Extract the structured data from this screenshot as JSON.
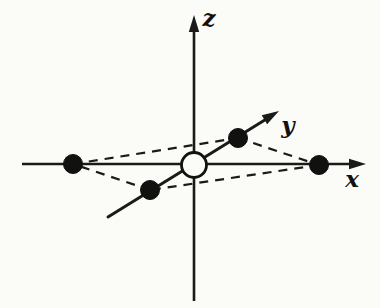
{
  "figure": {
    "kind": "3d-axes-lattice-diagram",
    "title": "",
    "background_color": "#fbfbf8",
    "ink_color": "#111110",
    "canvas": {
      "width": 380,
      "height": 308
    }
  },
  "axes": [
    {
      "id": "x",
      "label": "x",
      "label_x": 352,
      "label_y": 187,
      "label_size": 23,
      "start_x": 22,
      "start_y": 164,
      "end_x": 352,
      "end_y": 164,
      "tip_x": 366,
      "tip_y": 164,
      "stroke_width": 2.6,
      "has_arrow": true,
      "arrow_angle_deg": 0
    },
    {
      "id": "z",
      "label": "z",
      "label_x": 209,
      "label_y": 26,
      "label_size": 23,
      "start_x": 194,
      "start_y": 301,
      "end_x": 194,
      "end_y": 28,
      "tip_x": 194,
      "tip_y": 15,
      "stroke_width": 2.6,
      "has_arrow": true,
      "arrow_angle_deg": -90
    },
    {
      "id": "y",
      "label": "y",
      "label_x": 288,
      "label_y": 133,
      "label_size": 23,
      "start_x": 108,
      "start_y": 217,
      "end_x": 268,
      "end_y": 118,
      "tip_x": 279,
      "tip_y": 111,
      "stroke_width": 3.0,
      "has_arrow": true,
      "arrow_angle_deg": -31
    }
  ],
  "atoms": [
    {
      "id": "atom-left-x",
      "type": "filled",
      "cx": 73,
      "cy": 164,
      "r": 9.5
    },
    {
      "id": "atom-right-x",
      "type": "filled",
      "cx": 319,
      "cy": 165,
      "r": 9.5
    },
    {
      "id": "atom-upper-y",
      "type": "filled",
      "cx": 238,
      "cy": 138,
      "r": 9.5
    },
    {
      "id": "atom-lower-y",
      "type": "filled",
      "cx": 150,
      "cy": 190,
      "r": 9.5
    },
    {
      "id": "atom-center",
      "type": "hollow",
      "cx": 194,
      "cy": 165,
      "r": 12.5
    }
  ],
  "dashed_edges": [
    {
      "id": "edge-left-to-upper",
      "x1": 73,
      "y1": 164,
      "x2": 238,
      "y2": 138
    },
    {
      "id": "edge-upper-to-right",
      "x1": 238,
      "y1": 138,
      "x2": 319,
      "y2": 165
    },
    {
      "id": "edge-right-to-lower",
      "x1": 319,
      "y1": 165,
      "x2": 150,
      "y2": 190
    },
    {
      "id": "edge-lower-to-left",
      "x1": 150,
      "y1": 190,
      "x2": 73,
      "y2": 164
    }
  ],
  "dash_pattern": "9 7",
  "dash_stroke_width": 2.2
}
